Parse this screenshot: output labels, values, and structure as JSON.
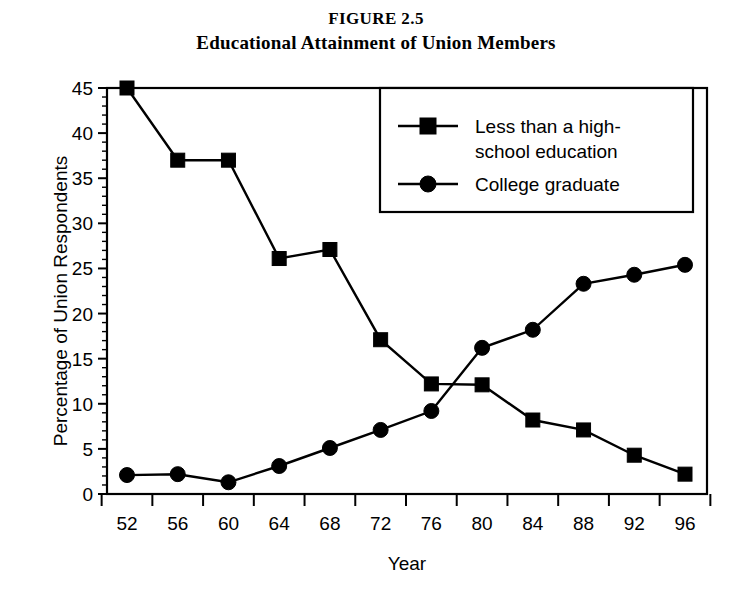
{
  "figure": {
    "number_label": "FIGURE 2.5",
    "title": "Educational Attainment of Union Members"
  },
  "axes": {
    "xlabel": "Year",
    "ylabel": "Percentage of Union Respondents"
  },
  "legend": {
    "position": "upper-center-right",
    "entries": [
      {
        "label_line1": "Less than a high-",
        "label_line2": "school education",
        "marker": "square-marker"
      },
      {
        "label_line1": "College graduate",
        "label_line2": "",
        "marker": "circle-marker"
      }
    ]
  },
  "chart_data": {
    "type": "line",
    "title": "Educational Attainment of Union Members",
    "subtitle": "FIGURE 2.5",
    "xlabel": "Year",
    "ylabel": "Percentage of Union Respondents",
    "x": [
      52,
      56,
      60,
      64,
      68,
      72,
      76,
      80,
      84,
      88,
      92,
      96
    ],
    "xticklabels": [
      "52",
      "56",
      "60",
      "64",
      "68",
      "72",
      "76",
      "80",
      "84",
      "88",
      "92",
      "96"
    ],
    "yticklabels": [
      "0",
      "5",
      "10",
      "15",
      "20",
      "25",
      "30",
      "35",
      "40",
      "45"
    ],
    "yticks": [
      0,
      5,
      10,
      15,
      20,
      25,
      30,
      35,
      40,
      45
    ],
    "ylim": [
      0,
      45
    ],
    "xlim": [
      50,
      98
    ],
    "grid": false,
    "minor_ticks": true,
    "legend_position": "upper right inside",
    "series": [
      {
        "name": "Less than a high-school education",
        "marker": "square",
        "color": "#000000",
        "values": [
          45.0,
          37.0,
          37.0,
          26.1,
          27.1,
          17.1,
          12.2,
          12.1,
          8.2,
          7.1,
          4.3,
          2.2
        ]
      },
      {
        "name": "College graduate",
        "marker": "circle",
        "color": "#000000",
        "values": [
          2.1,
          2.2,
          1.3,
          3.1,
          5.1,
          7.1,
          9.2,
          16.2,
          18.2,
          23.3,
          24.3,
          25.4
        ]
      }
    ]
  },
  "colors": {
    "line": "#000000",
    "frame": "#000000",
    "background": "#ffffff"
  }
}
